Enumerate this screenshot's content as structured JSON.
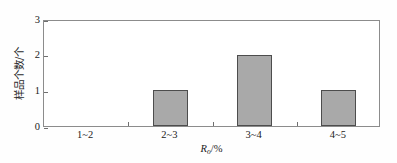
{
  "chart_data": {
    "type": "bar",
    "title": "",
    "subtitle": "",
    "categories": [
      "1~2",
      "2~3",
      "3~4",
      "4~5"
    ],
    "values": [
      0,
      1,
      2,
      1
    ],
    "xlabel_symbol": "R",
    "xlabel_subscript": "o",
    "xlabel_unit": "/%",
    "xlabel": "Ro/%",
    "ylabel": "样品个数/个",
    "ylim": [
      0,
      3
    ],
    "yticks": [
      0,
      1,
      2,
      3
    ],
    "ytick_labels": [
      "0",
      "1",
      "2",
      "3"
    ],
    "grid": false,
    "legend": false,
    "legend_position": "none",
    "bar_fill_color": "#a9a9a9",
    "bar_edge_color": "#4d4d4d",
    "axis_color": "#8c8c8c",
    "background_color": "#ffffff"
  }
}
